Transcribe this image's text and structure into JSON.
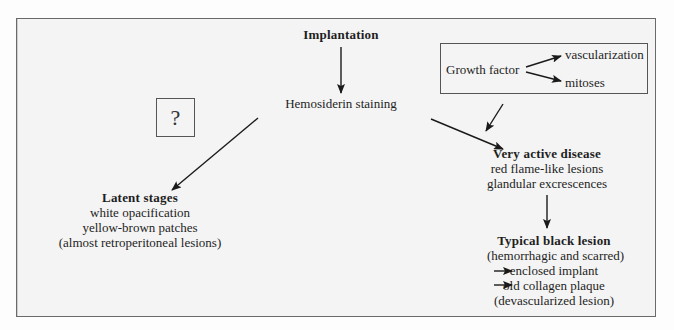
{
  "diagram": {
    "root": "Implantation",
    "hemosiderin": "Hemosiderin staining",
    "unknown": "?",
    "growth_factor": {
      "label": "Growth factor",
      "outputs": [
        "vascularization",
        "mitoses"
      ]
    },
    "latent": {
      "title": "Latent stages",
      "lines": [
        "white opacification",
        "yellow-brown patches",
        "(almost retroperitoneal lesions)"
      ]
    },
    "active": {
      "title": "Very active disease",
      "lines": [
        "red flame-like lesions",
        "glandular excrescences"
      ]
    },
    "black": {
      "title": "Typical black lesion",
      "subtitle": "(hemorrhagic and scarred)",
      "outcomes": [
        "enclosed implant",
        "old collagen plaque"
      ],
      "note": "(devascularized lesion)"
    }
  },
  "colors": {
    "line": "#1a1a1a",
    "frame_border": "#6a6a6a",
    "background": "#f4f4f4"
  }
}
